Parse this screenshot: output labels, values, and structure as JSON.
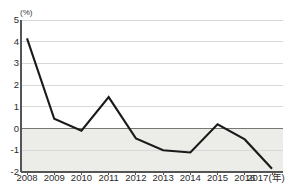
{
  "chart_data": {
    "type": "line",
    "title": "",
    "subtitle": "",
    "xlabel": "",
    "ylabel": "",
    "unit_label": "(%)",
    "x_axis_suffix": "(年)",
    "categories": [
      "2008",
      "2009",
      "2010",
      "2011",
      "2012",
      "2013",
      "2014",
      "2015",
      "2016",
      "2017"
    ],
    "values": [
      4.15,
      0.45,
      -0.1,
      1.45,
      -0.45,
      -1.0,
      -1.1,
      0.2,
      -0.5,
      -1.85
    ],
    "series": [
      {
        "name": "",
        "values": [
          4.15,
          0.45,
          -0.1,
          1.45,
          -0.45,
          -1.0,
          -1.1,
          0.2,
          -0.5,
          -1.85
        ]
      }
    ],
    "ylim": [
      -2,
      5
    ],
    "yticks": [
      5,
      4,
      3,
      2,
      1,
      0,
      -1,
      -2
    ],
    "ytick_labels": [
      "5",
      "4",
      "3",
      "2",
      "1",
      "0",
      "-1",
      "-2"
    ],
    "xtick_labels": [
      "2008",
      "2009",
      "2010",
      "2011",
      "2012",
      "2013",
      "2014",
      "2015",
      "2016",
      "2017(年)"
    ],
    "grid": true,
    "legend": false,
    "zero_line": 0,
    "negative_region_shaded": true,
    "colors": {
      "line": "#1a1a1a",
      "grid": "#d8d8d8",
      "zero_line": "#777777",
      "axis": "#555555",
      "negative_band": "#ecedE8",
      "background": "#ffffff",
      "text": "#2b2b2b"
    }
  }
}
